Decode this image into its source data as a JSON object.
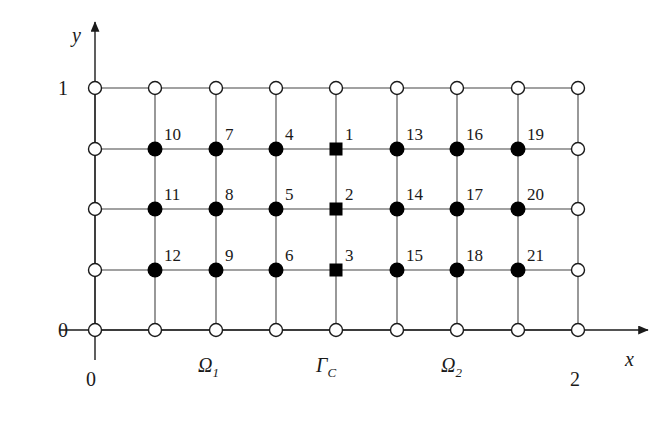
{
  "figure": {
    "width": 660,
    "height": 426,
    "background": "#ffffff",
    "ink_color": "#1a1a1a"
  },
  "axes": {
    "x": {
      "name": "x",
      "label": "x",
      "label_pos": {
        "x": 625,
        "y": 349
      },
      "origin_tick_label": "0",
      "origin_tick_pos": {
        "x": 86,
        "y": 369
      },
      "end_tick_label": "2",
      "end_tick_pos": {
        "x": 570,
        "y": 369
      },
      "line": {
        "x1": 60,
        "y1": 330,
        "x2": 648,
        "y2": 330
      },
      "arrow": true
    },
    "y": {
      "name": "y",
      "label": "y",
      "label_pos": {
        "x": 72,
        "y": 25
      },
      "top_tick_label": "1",
      "top_tick_pos": {
        "x": 58,
        "y": 78
      },
      "zero_tick_label": "0",
      "zero_tick_pos": {
        "x": 58,
        "y": 320
      },
      "line": {
        "x1": 95,
        "y1": 360,
        "x2": 95,
        "y2": 22
      },
      "arrow": true
    }
  },
  "grid": {
    "columns_x": [
      95,
      155,
      216,
      276,
      336,
      397,
      457,
      518,
      578
    ],
    "rows_y": [
      88,
      149,
      209,
      270,
      330
    ],
    "line_color": "#444444",
    "line_width": 1.1,
    "column_count": 9,
    "row_count": 5
  },
  "markers": {
    "open_circle": {
      "name": "boundary-node",
      "radius": 6.5,
      "fill": "#ffffff",
      "stroke": "#1a1a1a",
      "stroke_width": 1.4
    },
    "filled_circle": {
      "name": "interior-node",
      "radius": 7.5,
      "fill": "#000000"
    },
    "filled_square": {
      "name": "interface-node",
      "size": 13,
      "fill": "#000000"
    }
  },
  "nodes": [
    {
      "id": 1,
      "label": "1",
      "col": 4,
      "row": 1,
      "x": 336,
      "y": 149,
      "shape": "square"
    },
    {
      "id": 2,
      "label": "2",
      "col": 4,
      "row": 2,
      "x": 336,
      "y": 209,
      "shape": "square"
    },
    {
      "id": 3,
      "label": "3",
      "col": 4,
      "row": 3,
      "x": 336,
      "y": 270,
      "shape": "square"
    },
    {
      "id": 4,
      "label": "4",
      "col": 3,
      "row": 1,
      "x": 276,
      "y": 149,
      "shape": "circle"
    },
    {
      "id": 5,
      "label": "5",
      "col": 3,
      "row": 2,
      "x": 276,
      "y": 209,
      "shape": "circle"
    },
    {
      "id": 6,
      "label": "6",
      "col": 3,
      "row": 3,
      "x": 276,
      "y": 270,
      "shape": "circle"
    },
    {
      "id": 7,
      "label": "7",
      "col": 2,
      "row": 1,
      "x": 216,
      "y": 149,
      "shape": "circle"
    },
    {
      "id": 8,
      "label": "8",
      "col": 2,
      "row": 2,
      "x": 216,
      "y": 209,
      "shape": "circle"
    },
    {
      "id": 9,
      "label": "9",
      "col": 2,
      "row": 3,
      "x": 216,
      "y": 270,
      "shape": "circle"
    },
    {
      "id": 10,
      "label": "10",
      "col": 1,
      "row": 1,
      "x": 155,
      "y": 149,
      "shape": "circle"
    },
    {
      "id": 11,
      "label": "11",
      "col": 1,
      "row": 2,
      "x": 155,
      "y": 209,
      "shape": "circle"
    },
    {
      "id": 12,
      "label": "12",
      "col": 1,
      "row": 3,
      "x": 155,
      "y": 270,
      "shape": "circle"
    },
    {
      "id": 13,
      "label": "13",
      "col": 5,
      "row": 1,
      "x": 397,
      "y": 149,
      "shape": "circle"
    },
    {
      "id": 14,
      "label": "14",
      "col": 5,
      "row": 2,
      "x": 397,
      "y": 209,
      "shape": "circle"
    },
    {
      "id": 15,
      "label": "15",
      "col": 5,
      "row": 3,
      "x": 397,
      "y": 270,
      "shape": "circle"
    },
    {
      "id": 16,
      "label": "16",
      "col": 6,
      "row": 1,
      "x": 457,
      "y": 149,
      "shape": "circle"
    },
    {
      "id": 17,
      "label": "17",
      "col": 6,
      "row": 2,
      "x": 457,
      "y": 209,
      "shape": "circle"
    },
    {
      "id": 18,
      "label": "18",
      "col": 6,
      "row": 3,
      "x": 457,
      "y": 270,
      "shape": "circle"
    },
    {
      "id": 19,
      "label": "19",
      "col": 7,
      "row": 1,
      "x": 518,
      "y": 149,
      "shape": "circle"
    },
    {
      "id": 20,
      "label": "20",
      "col": 7,
      "row": 2,
      "x": 518,
      "y": 209,
      "shape": "circle"
    },
    {
      "id": 21,
      "label": "21",
      "col": 7,
      "row": 3,
      "x": 518,
      "y": 270,
      "shape": "circle"
    }
  ],
  "boundary_nodes": [
    {
      "x": 95,
      "y": 88
    },
    {
      "x": 155,
      "y": 88
    },
    {
      "x": 216,
      "y": 88
    },
    {
      "x": 276,
      "y": 88
    },
    {
      "x": 336,
      "y": 88
    },
    {
      "x": 397,
      "y": 88
    },
    {
      "x": 457,
      "y": 88
    },
    {
      "x": 518,
      "y": 88
    },
    {
      "x": 578,
      "y": 88
    },
    {
      "x": 95,
      "y": 149
    },
    {
      "x": 578,
      "y": 149
    },
    {
      "x": 95,
      "y": 209
    },
    {
      "x": 578,
      "y": 209
    },
    {
      "x": 95,
      "y": 270
    },
    {
      "x": 578,
      "y": 270
    },
    {
      "x": 95,
      "y": 330
    },
    {
      "x": 155,
      "y": 330
    },
    {
      "x": 216,
      "y": 330
    },
    {
      "x": 276,
      "y": 330
    },
    {
      "x": 336,
      "y": 330
    },
    {
      "x": 397,
      "y": 330
    },
    {
      "x": 457,
      "y": 330
    },
    {
      "x": 518,
      "y": 330
    },
    {
      "x": 578,
      "y": 330
    }
  ],
  "regions": [
    {
      "id": "omega1",
      "base": "Ω",
      "sub": "1",
      "x": 198,
      "y": 355
    },
    {
      "id": "gammaC",
      "base": "Γ",
      "sub": "C",
      "x": 316,
      "y": 355
    },
    {
      "id": "omega2",
      "base": "Ω",
      "sub": "2",
      "x": 441,
      "y": 355
    }
  ],
  "chart_data": {
    "type": "scatter",
    "xlabel": "x",
    "ylabel": "y",
    "xlim": [
      0,
      2
    ],
    "ylim": [
      0,
      1
    ],
    "xticks": [
      "0",
      "2"
    ],
    "yticks": [
      "0",
      "1"
    ],
    "grid": true,
    "legend": "none",
    "annotations": [
      "Ω₁",
      "Γ_C",
      "Ω₂"
    ],
    "series": [
      {
        "name": "interface nodes (filled squares)",
        "marker": "square",
        "labels": [
          "1",
          "2",
          "3"
        ],
        "x": [
          1.0,
          1.0,
          1.0
        ],
        "y": [
          0.75,
          0.5,
          0.25
        ]
      },
      {
        "name": "interior nodes Ω₁ (filled circles)",
        "marker": "circle",
        "labels": [
          "4",
          "5",
          "6",
          "7",
          "8",
          "9",
          "10",
          "11",
          "12"
        ],
        "x": [
          0.75,
          0.75,
          0.75,
          0.5,
          0.5,
          0.5,
          0.25,
          0.25,
          0.25
        ],
        "y": [
          0.75,
          0.5,
          0.25,
          0.75,
          0.5,
          0.25,
          0.75,
          0.5,
          0.25
        ]
      },
      {
        "name": "interior nodes Ω₂ (filled circles)",
        "marker": "circle",
        "labels": [
          "13",
          "14",
          "15",
          "16",
          "17",
          "18",
          "19",
          "20",
          "21"
        ],
        "x": [
          1.25,
          1.25,
          1.25,
          1.5,
          1.5,
          1.5,
          1.75,
          1.75,
          1.75
        ],
        "y": [
          0.75,
          0.5,
          0.25,
          0.75,
          0.5,
          0.25,
          0.75,
          0.5,
          0.25
        ]
      },
      {
        "name": "boundary nodes (open circles)",
        "marker": "open-circle",
        "labels": [],
        "x": [
          0,
          0.25,
          0.5,
          0.75,
          1.0,
          1.25,
          1.5,
          1.75,
          2.0,
          0,
          2.0,
          0,
          2.0,
          0,
          2.0,
          0,
          0.25,
          0.5,
          0.75,
          1.0,
          1.25,
          1.5,
          1.75,
          2.0
        ],
        "y": [
          1,
          1,
          1,
          1,
          1,
          1,
          1,
          1,
          1,
          0.75,
          0.75,
          0.5,
          0.5,
          0.25,
          0.25,
          0,
          0,
          0,
          0,
          0,
          0,
          0,
          0,
          0
        ]
      }
    ]
  }
}
